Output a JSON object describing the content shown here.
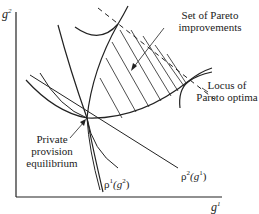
{
  "diagram": {
    "axes": {
      "y_label_base": "g",
      "y_label_sup": "2",
      "x_label_base": "g",
      "x_label_sup": "1"
    },
    "labels": {
      "pareto_set_line1": "Set of Pareto",
      "pareto_set_line2": "improvements",
      "locus_line1": "Locus of",
      "locus_line2": "Pareto optima",
      "equilibrium_line1": "Private",
      "equilibrium_line2": "provision",
      "equilibrium_line3": "equilibrium",
      "rho1_prefix": "ρ",
      "rho1_sup": "1",
      "rho1_arg": "(g",
      "rho1_arg_sup": "2",
      "rho1_close": ")",
      "rho2_prefix": "ρ",
      "rho2_sup": "2",
      "rho2_arg": "(g",
      "rho2_arg_sup": "1",
      "rho2_close": ")"
    },
    "colors": {
      "line": "#222222",
      "background": "#ffffff"
    }
  }
}
